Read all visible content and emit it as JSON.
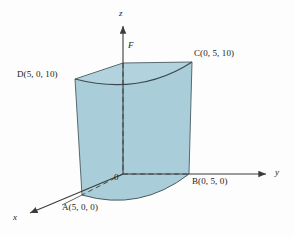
{
  "figure": {
    "background_color": "#fdfdfd",
    "solid_fill": "#a9ced9",
    "solid_fill_top": "#b4d5de",
    "edge_color": "#4a5a62",
    "axis_color": "#3c3c3c"
  },
  "axes": {
    "z_label": "z",
    "y_label": "y",
    "x_label": "x",
    "origin_label": "0"
  },
  "points": {
    "A": "A(5, 0, 0)",
    "B": "B(0, 5, 0)",
    "C": "C(0, 5, 10)",
    "D": "D(5, 0, 10)",
    "F": "F"
  }
}
